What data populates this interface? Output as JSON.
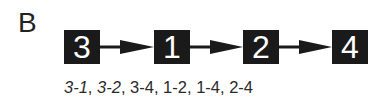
{
  "panel_label": "B",
  "nodes": [
    {
      "id": "3",
      "label": "3"
    },
    {
      "id": "1",
      "label": "1"
    },
    {
      "id": "2",
      "label": "2"
    },
    {
      "id": "4",
      "label": "4"
    }
  ],
  "edges": [
    {
      "from": "3",
      "to": "1"
    },
    {
      "from": "1",
      "to": "2"
    },
    {
      "from": "2",
      "to": "4"
    }
  ],
  "pairs": [
    "3-1",
    "3-2",
    "3-4",
    "1-2",
    "1-4",
    "2-4"
  ],
  "pairs_separator": ", ",
  "colors": {
    "node_fill": "#1a1a1a",
    "node_text": "#ffffff",
    "arrow": "#1a1a1a"
  }
}
